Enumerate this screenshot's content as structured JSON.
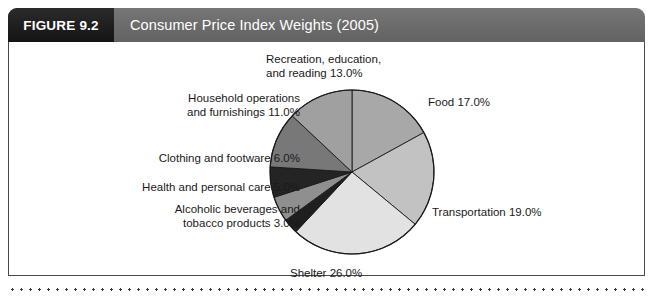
{
  "figure": {
    "tag": "FIGURE 9.2",
    "title": "Consumer Price Index Weights (2005)"
  },
  "colors": {
    "header_bar": "#6e6e6e",
    "tag_box": "#1d1d1d",
    "panel_border": "#4a4a4a",
    "slice_stroke": "#1a1a1a",
    "text": "#1a1a1a"
  },
  "chart_data": {
    "type": "pie",
    "title": "Consumer Price Index Weights (2005)",
    "xlabel": "",
    "ylabel": "",
    "units": "percent",
    "start_angle_deg": 0,
    "direction": "clockwise",
    "legend_position": "none",
    "grid": false,
    "labels_shown_as": "callout text around pie",
    "categories": [
      "Food",
      "Transportation",
      "Shelter",
      "Alcoholic beverages and tobacco products",
      "Health and personal care",
      "Clothing and footware",
      "Household operations and furnishings",
      "Recreation, education, and reading"
    ],
    "values": [
      17.0,
      19.0,
      26.0,
      3.0,
      5.0,
      6.0,
      11.0,
      13.0
    ],
    "total": 100.0,
    "slices": [
      {
        "name": "Food",
        "value": 17.0,
        "label": "Food 17.0%",
        "color": "#a8a8a8"
      },
      {
        "name": "Transportation",
        "value": 19.0,
        "label": "Transportation 19.0%",
        "color": "#c2c2c2"
      },
      {
        "name": "Shelter",
        "value": 26.0,
        "label": "Shelter 26.0%",
        "color": "#e2e2e2"
      },
      {
        "name": "Alcoholic beverages and tobacco products",
        "value": 3.0,
        "label": "Alcoholic beverages and\ntobacco products  3.0%",
        "color": "#1f1f1f"
      },
      {
        "name": "Health and personal care",
        "value": 5.0,
        "label": "Health and personal care 5.0%",
        "color": "#8f8f8f"
      },
      {
        "name": "Clothing and footware",
        "value": 6.0,
        "label": "Clothing and footware 6.0%",
        "color": "#242424"
      },
      {
        "name": "Household operations and furnishings",
        "value": 11.0,
        "label": "Household operations\nand furnishings 11.0%",
        "color": "#787878"
      },
      {
        "name": "Recreation, education, and reading",
        "value": 13.0,
        "label": "Recreation, education,\nand reading 13.0%",
        "color": "#a0a0a0"
      }
    ]
  }
}
